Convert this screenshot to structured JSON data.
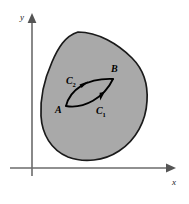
{
  "figure": {
    "background_color": "#ffffff",
    "axes": {
      "x_label": "x",
      "y_label": "y",
      "axis_color": "#6b6b6b",
      "origin": {
        "x": 32,
        "y": 168
      },
      "x_axis_start": {
        "x": 10,
        "y": 168
      },
      "x_axis_end": {
        "x": 172,
        "y": 168
      },
      "y_axis_start": {
        "x": 32,
        "y": 176
      },
      "y_axis_end": {
        "x": 32,
        "y": 16
      }
    },
    "region": {
      "name": "shaded-region",
      "fill_color": "#a9a9a9",
      "stroke_color": "#1a1a1a",
      "stroke_width": 1.6
    },
    "points": [
      {
        "id": "A",
        "label": "A",
        "x": 66,
        "y": 106,
        "label_x": 58,
        "label_y": 112
      },
      {
        "id": "B",
        "label": "B",
        "x": 113,
        "y": 79,
        "label_x": 113,
        "label_y": 73
      }
    ],
    "curves": [
      {
        "id": "C1",
        "label": "C",
        "subscript": "1",
        "description": "lower path from A to B traversed toward B",
        "label_x": 98,
        "label_y": 113,
        "stroke_color": "#000000",
        "stroke_width": 1.7
      },
      {
        "id": "C2",
        "label": "C",
        "subscript": "2",
        "description": "upper path from A to B traversed toward B",
        "label_x": 68,
        "label_y": 83,
        "stroke_color": "#000000",
        "stroke_width": 1.7
      }
    ]
  }
}
